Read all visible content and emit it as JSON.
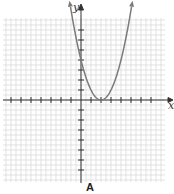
{
  "chart_data": {
    "type": "line",
    "title": "",
    "caption": "A",
    "xlabel": "x",
    "ylabel": "y",
    "xlim": [
      -8,
      8
    ],
    "ylim": [
      -8,
      8
    ],
    "grid": true,
    "function": "y = (x - 2)^2",
    "series": [
      {
        "name": "parabola",
        "x": [
          -1.1,
          -1,
          0,
          1,
          2,
          3,
          4,
          5,
          5.1
        ],
        "y": [
          9.6,
          9,
          4,
          1,
          0,
          1,
          4,
          9,
          9.6
        ]
      }
    ],
    "vertex": [
      2,
      0
    ],
    "y_intercept": 4
  },
  "labels": {
    "x_axis": "x",
    "y_axis": "y",
    "caption": "A"
  },
  "colors": {
    "curve": "#7a7a7a",
    "grid": "#d4d4d4",
    "axis": "#333333"
  }
}
